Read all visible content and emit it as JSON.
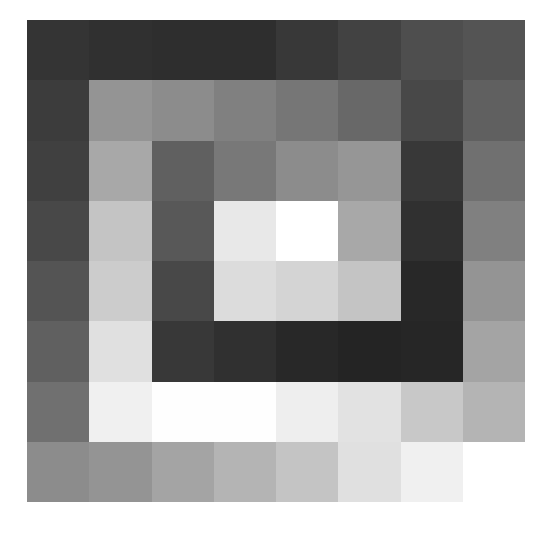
{
  "chart_data": {
    "type": "heatmap",
    "title": "",
    "xlabel": "",
    "ylabel": "",
    "rows": 8,
    "cols": 8,
    "colormap": "grayscale",
    "value_range": [
      0,
      255
    ],
    "grid": false,
    "legend": "none",
    "values": [
      [
        52,
        48,
        46,
        46,
        56,
        66,
        78,
        84
      ],
      [
        60,
        148,
        140,
        128,
        118,
        104,
        72,
        96
      ],
      [
        64,
        168,
        96,
        120,
        140,
        150,
        56,
        112
      ],
      [
        72,
        196,
        88,
        232,
        255,
        168,
        48,
        128
      ],
      [
        84,
        204,
        72,
        220,
        212,
        196,
        40,
        148
      ],
      [
        96,
        224,
        56,
        48,
        40,
        36,
        38,
        164
      ],
      [
        112,
        240,
        254,
        254,
        238,
        226,
        200,
        180
      ],
      [
        140,
        148,
        164,
        180,
        196,
        224,
        240,
        null
      ]
    ]
  },
  "grid": {
    "left": 27,
    "top": 20,
    "width": 498,
    "height": 482,
    "empty_color": "#ffffff"
  }
}
